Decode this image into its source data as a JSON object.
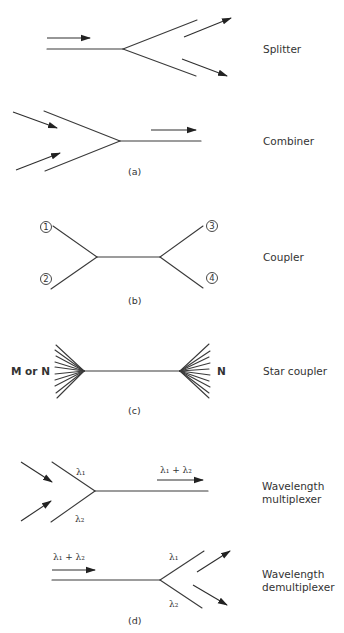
{
  "figure": {
    "panels": [
      {
        "caption": "(a)",
        "devices": [
          {
            "name": "splitter",
            "label": "Splitter"
          },
          {
            "name": "combiner",
            "label": "Combiner"
          }
        ]
      },
      {
        "caption": "(b)",
        "devices": [
          {
            "name": "coupler",
            "label": "Coupler",
            "ports": [
              "1",
              "2",
              "3",
              "4"
            ]
          }
        ]
      },
      {
        "caption": "(c)",
        "devices": [
          {
            "name": "star-coupler",
            "label": "Star coupler",
            "left_label": "M or N",
            "right_label": "N"
          }
        ]
      },
      {
        "caption": "(d)",
        "devices": [
          {
            "name": "wavelength-multiplexer",
            "label_line1": "Wavelength",
            "label_line2": "multiplexer",
            "input1": "λ₁",
            "input2": "λ₂",
            "output": "λ₁ + λ₂"
          },
          {
            "name": "wavelength-demultiplexer",
            "label_line1": "Wavelength",
            "label_line2": "demultiplexer",
            "input": "λ₁ + λ₂",
            "output1": "λ₁",
            "output2": "λ₂"
          }
        ]
      }
    ],
    "colors": {
      "line": "#3a3a3a",
      "text": "#333333",
      "background": "#ffffff"
    }
  }
}
